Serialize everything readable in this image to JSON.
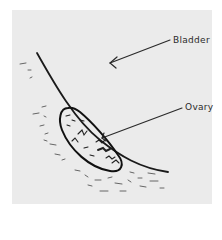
{
  "diagram": {
    "type": "anatomical-ultrasound-sketch",
    "labels": [
      {
        "id": "bladder",
        "text": "Bladder"
      },
      {
        "id": "ovary",
        "text": "Ovary"
      }
    ],
    "colors": {
      "background": "#ffffff",
      "panel": "#ebebeb",
      "ink": "#1a1a1a"
    }
  }
}
